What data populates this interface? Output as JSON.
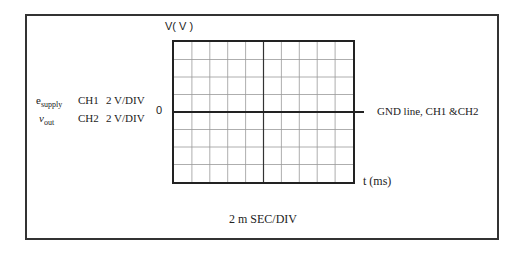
{
  "diagram": {
    "y_axis_label": "V( V )",
    "x_axis_label": "t (ms)",
    "zero_label": "0",
    "gnd_label": "GND line, CH1 &CH2",
    "time_base": "2 m SEC/DIV",
    "grid": {
      "columns": 10,
      "rows": 8
    },
    "channels": [
      {
        "signal": "e",
        "signal_sub": "supply",
        "channel": "CH1",
        "scale": "2 V/DIV"
      },
      {
        "signal": "v",
        "signal_sub": "out",
        "channel": "CH2",
        "scale": "2 V/DIV"
      }
    ]
  }
}
